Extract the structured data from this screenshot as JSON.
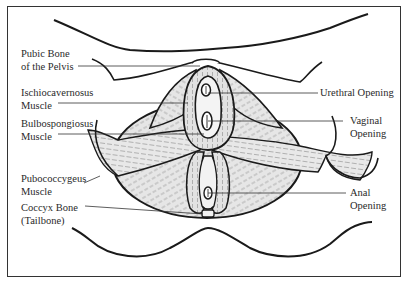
{
  "diagram": {
    "colors": {
      "outline": "#1a1a1a",
      "leader": "#333333",
      "muscle_fill": "#e4e4e4",
      "muscle_hatch": "#8a8a8a",
      "opening_fill": "#f4f4f4",
      "frame": "#333333"
    },
    "labels_left": [
      {
        "id": "pubic-bone",
        "line1": "Pubic Bone",
        "line2": "of the Pelvis"
      },
      {
        "id": "ischiocavernosus",
        "line1": "Ischiocavernosus",
        "line2": "Muscle"
      },
      {
        "id": "bulbospongiosus",
        "line1": "Bulbospongiosus",
        "line2": "Muscle"
      },
      {
        "id": "pubococcygeus",
        "line1": "Pubococcygeus",
        "line2": "Muscle"
      },
      {
        "id": "coccyx",
        "line1": "Coccyx Bone",
        "line2": "(Tailbone)"
      }
    ],
    "labels_right": [
      {
        "id": "urethral-opening",
        "line1": "Urethral Opening"
      },
      {
        "id": "vaginal-opening",
        "line1": "Vaginal",
        "line2": "Opening"
      },
      {
        "id": "anal-opening",
        "line1": "Anal",
        "line2": "Opening"
      }
    ]
  }
}
